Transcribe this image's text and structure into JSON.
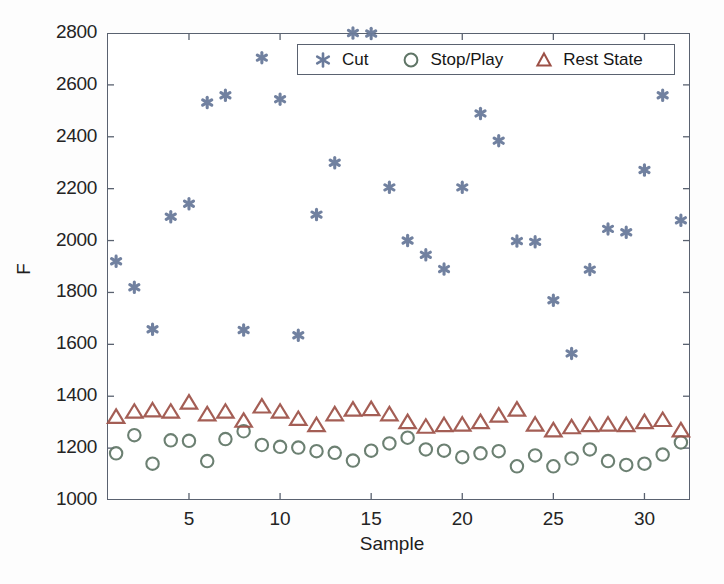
{
  "figure": {
    "background": "#ffffff",
    "axis_color": "#5a6270"
  },
  "axes": {
    "xlabel": "Sample",
    "ylabel": "F",
    "y_ticks": [
      "1000",
      "1200",
      "1400",
      "1600",
      "1800",
      "2000",
      "2200",
      "2400",
      "2600",
      "2800"
    ],
    "x_ticks": [
      "5",
      "10",
      "15",
      "20",
      "25",
      "30"
    ]
  },
  "legend": {
    "entries": [
      {
        "label": "Cut",
        "marker": "asterisk-marker",
        "color": "#6a7b9b"
      },
      {
        "label": "Stop/Play",
        "marker": "circle-marker",
        "color": "#5f7566"
      },
      {
        "label": "Rest State",
        "marker": "triangle-marker",
        "color": "#9c5046"
      }
    ]
  },
  "chart_data": {
    "type": "scatter",
    "title": "",
    "xlabel": "Sample",
    "ylabel": "F",
    "xlim": [
      0.5,
      32.5
    ],
    "ylim": [
      1000,
      2800
    ],
    "xticks": [
      5,
      10,
      15,
      20,
      25,
      30
    ],
    "yticks": [
      1000,
      1200,
      1400,
      1600,
      1800,
      2000,
      2200,
      2400,
      2600,
      2800
    ],
    "grid": false,
    "legend_position": "upper right",
    "x": [
      1,
      2,
      3,
      4,
      5,
      6,
      7,
      8,
      9,
      10,
      11,
      12,
      13,
      14,
      15,
      16,
      17,
      18,
      19,
      20,
      21,
      22,
      23,
      24,
      25,
      26,
      27,
      28,
      29,
      30,
      31,
      32
    ],
    "series": [
      {
        "name": "Cut",
        "marker": "asterisk",
        "color": "#6a7b9b",
        "values": [
          1920,
          1820,
          1658,
          2092,
          2142,
          2532,
          2560,
          1655,
          2705,
          2545,
          1635,
          2100,
          2300,
          2800,
          2798,
          2205,
          2000,
          1945,
          1890,
          2205,
          2490,
          2385,
          1998,
          1995,
          1770,
          1565,
          1888,
          2045,
          2032,
          2272,
          2560,
          2078
        ]
      },
      {
        "name": "Stop/Play",
        "marker": "circle",
        "color": "#5f7566",
        "values": [
          1180,
          1250,
          1140,
          1230,
          1228,
          1150,
          1235,
          1265,
          1212,
          1205,
          1202,
          1188,
          1182,
          1152,
          1190,
          1218,
          1240,
          1195,
          1190,
          1165,
          1180,
          1188,
          1130,
          1172,
          1130,
          1160,
          1195,
          1150,
          1135,
          1140,
          1175,
          1222
        ]
      },
      {
        "name": "Rest State",
        "marker": "triangle",
        "color": "#9c5046",
        "values": [
          1320,
          1340,
          1345,
          1340,
          1375,
          1330,
          1340,
          1305,
          1360,
          1340,
          1312,
          1288,
          1330,
          1348,
          1350,
          1330,
          1300,
          1282,
          1288,
          1290,
          1300,
          1325,
          1348,
          1290,
          1268,
          1280,
          1288,
          1290,
          1288,
          1300,
          1308,
          1268
        ]
      }
    ]
  }
}
